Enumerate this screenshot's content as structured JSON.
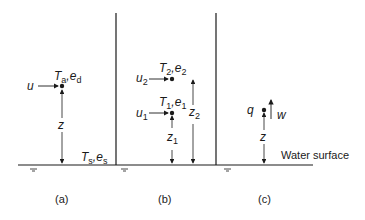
{
  "figure": {
    "surface_label": "Water surface",
    "panels": [
      {
        "id": "a",
        "caption": "(a)",
        "point_label": {
          "var1": "T",
          "sub1": "a",
          "var2": "e",
          "sub2": "d"
        },
        "wind_label": "u",
        "height_label": "z",
        "surface_vars": {
          "var1": "T",
          "sub1": "s",
          "var2": "e",
          "sub2": "s"
        }
      },
      {
        "id": "b",
        "caption": "(b)",
        "upper_point_label": {
          "var1": "T",
          "sub1": "2",
          "var2": "e",
          "sub2": "2"
        },
        "upper_wind_label": "u",
        "upper_wind_sub": "2",
        "lower_point_label": {
          "var1": "T",
          "sub1": "1",
          "var2": "e",
          "sub2": "1"
        },
        "lower_wind_label": "u",
        "lower_wind_sub": "1",
        "lower_height_label": "z",
        "lower_height_sub": "1",
        "upper_height_label": "z",
        "upper_height_sub": "2"
      },
      {
        "id": "c",
        "caption": "(c)",
        "humidity_label": "q",
        "vertical_velocity_label": "w",
        "height_label": "z"
      }
    ],
    "colors": {
      "ink": "#1a1a1a",
      "background": "#ffffff"
    }
  }
}
